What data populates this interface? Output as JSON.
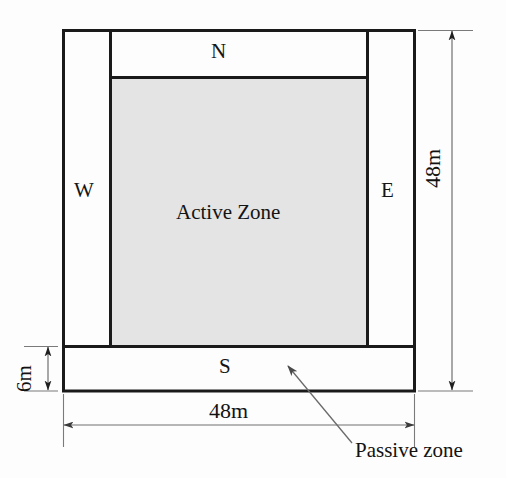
{
  "diagram": {
    "zones": [
      {
        "id": "north",
        "label": "N",
        "type": "passive"
      },
      {
        "id": "west",
        "label": "W",
        "type": "passive"
      },
      {
        "id": "east",
        "label": "E",
        "type": "passive"
      },
      {
        "id": "south",
        "label": "S",
        "type": "passive"
      }
    ],
    "active_zone": {
      "label": "Active Zone",
      "fill_color": "#e4e4e4"
    },
    "dimensions": [
      {
        "id": "height-right",
        "value": "48m",
        "orientation": "vertical",
        "side": "right"
      },
      {
        "id": "width-bottom",
        "value": "48m",
        "orientation": "horizontal",
        "side": "bottom"
      },
      {
        "id": "passive-strip-depth",
        "value": "6m",
        "orientation": "vertical",
        "side": "left"
      }
    ],
    "callout": {
      "label": "Passive zone"
    },
    "colors": {
      "outline": "#1a1a1a",
      "active_fill": "#e4e4e4",
      "dimension_line": "#6e6e6e",
      "background": "#fdfdfd"
    }
  }
}
